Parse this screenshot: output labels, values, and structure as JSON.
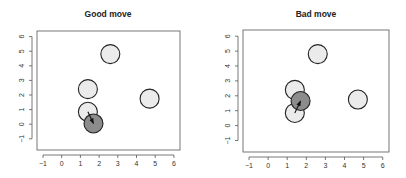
{
  "chart_data": [
    {
      "type": "scatter",
      "title": "Good move",
      "xlabel": "",
      "ylabel": "",
      "xlim": [
        -1.3,
        6.3
      ],
      "ylim": [
        -1.4,
        6.4
      ],
      "xticks": [
        -1,
        0,
        1,
        2,
        3,
        4,
        5,
        6
      ],
      "yticks": [
        -1,
        0,
        1,
        2,
        3,
        4,
        5,
        6
      ],
      "grid": false,
      "points": [
        {
          "x": 2.6,
          "y": 4.8,
          "fill": "#ebebeb",
          "role": "static"
        },
        {
          "x": 1.4,
          "y": 2.4,
          "fill": "#ebebeb",
          "role": "static"
        },
        {
          "x": 4.7,
          "y": 1.75,
          "fill": "#ebebeb",
          "role": "static"
        },
        {
          "x": 1.4,
          "y": 0.85,
          "fill": "#ebebeb",
          "role": "start"
        },
        {
          "x": 1.7,
          "y": 0.05,
          "fill": "#8c8c8c",
          "role": "moved"
        }
      ],
      "arrow": {
        "from": [
          1.4,
          0.85
        ],
        "to": [
          1.7,
          0.05
        ]
      }
    },
    {
      "type": "scatter",
      "title": "Bad move",
      "xlabel": "",
      "ylabel": "",
      "xlim": [
        -1.3,
        6.3
      ],
      "ylim": [
        -1.4,
        6.4
      ],
      "xticks": [
        -1,
        0,
        1,
        2,
        3,
        4,
        5,
        6
      ],
      "yticks": [
        -1,
        0,
        1,
        2,
        3,
        4,
        5,
        6
      ],
      "grid": false,
      "points": [
        {
          "x": 2.6,
          "y": 4.8,
          "fill": "#ebebeb",
          "role": "static"
        },
        {
          "x": 1.4,
          "y": 2.4,
          "fill": "#ebebeb",
          "role": "static"
        },
        {
          "x": 4.7,
          "y": 1.75,
          "fill": "#ebebeb",
          "role": "static"
        },
        {
          "x": 1.4,
          "y": 0.85,
          "fill": "#ebebeb",
          "role": "start"
        },
        {
          "x": 1.7,
          "y": 1.65,
          "fill": "#8c8c8c",
          "role": "moved"
        }
      ],
      "arrow": {
        "from": [
          1.4,
          0.85
        ],
        "to": [
          1.7,
          1.65
        ]
      }
    }
  ],
  "panels": [
    {
      "title": "Good move"
    },
    {
      "title": "Bad move"
    }
  ],
  "colors": {
    "circle_fill": "#ebebeb",
    "moved_fill": "#8c8c8c",
    "stroke": "#222222",
    "axis": "#555555"
  }
}
